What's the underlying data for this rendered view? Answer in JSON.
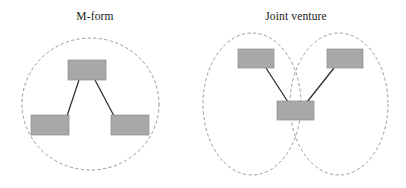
{
  "figure": {
    "background_color": "#ffffff",
    "box_fill_color": "#a8a8a8",
    "box_stroke_color": "#8d8d8d",
    "ellipse_stroke_color": "#8e8e8e",
    "link_color": "#2b2b2b",
    "panels": [
      {
        "id": "m-form",
        "title": "M-form",
        "boundaries": [
          {
            "name": "firm-boundary",
            "cx": 90.5,
            "cy": 104,
            "rx": 68.5,
            "ry": 66
          }
        ],
        "nodes": [
          {
            "name": "parent-unit",
            "x": 68,
            "y": 60,
            "w": 38,
            "h": 20
          },
          {
            "name": "division-left",
            "x": 31,
            "y": 115,
            "w": 38,
            "h": 20
          },
          {
            "name": "division-right",
            "x": 111,
            "y": 115,
            "w": 38,
            "h": 20
          }
        ],
        "links": [
          {
            "name": "parent-to-division-left",
            "x1": 79,
            "y1": 80,
            "x2": 67,
            "y2": 116
          },
          {
            "name": "parent-to-division-right",
            "x1": 95,
            "y1": 80,
            "x2": 114,
            "y2": 116
          }
        ]
      },
      {
        "id": "joint-venture",
        "title": "Joint venture",
        "boundaries": [
          {
            "name": "parent-firm-boundary-left",
            "cx": 252,
            "cy": 104,
            "rx": 49,
            "ry": 71
          },
          {
            "name": "parent-firm-boundary-right",
            "cx": 339,
            "cy": 104,
            "rx": 49,
            "ry": 71
          }
        ],
        "nodes": [
          {
            "name": "parent-left-unit",
            "x": 238,
            "y": 49,
            "w": 36,
            "h": 19
          },
          {
            "name": "parent-right-unit",
            "x": 327,
            "y": 49,
            "w": 36,
            "h": 19
          },
          {
            "name": "joint-venture-unit",
            "x": 277,
            "y": 101,
            "w": 37,
            "h": 19
          }
        ],
        "links": [
          {
            "name": "parent-left-to-jv",
            "x1": 266,
            "y1": 68,
            "x2": 288,
            "y2": 102
          },
          {
            "name": "parent-right-to-jv",
            "x1": 334,
            "y1": 68,
            "x2": 307,
            "y2": 102
          }
        ]
      }
    ]
  }
}
